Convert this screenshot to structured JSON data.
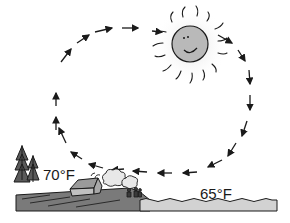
{
  "diagram": {
    "type": "convection cycle (sea breeze)",
    "land_label": "70°F",
    "sea_label": "65°F",
    "elements": [
      "sun",
      "circulation-arrows",
      "trees",
      "house",
      "smoke",
      "people",
      "land",
      "sea"
    ],
    "colors": {
      "sun_face": "#b9b9b9",
      "sun_glow": "#e6e6e6",
      "land": "#7a7a7a",
      "sea": "#d2d2d2",
      "ink": "#1a1a1a"
    }
  }
}
